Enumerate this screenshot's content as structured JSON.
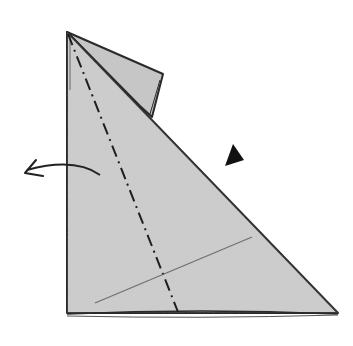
{
  "diagram": {
    "type": "origami-step",
    "paper_color": "#c9c9c9",
    "line_color": "#2a2a2a",
    "background": "#ffffff",
    "elements": [
      {
        "name": "folded-paper-triangle",
        "description": "large right triangle of folded paper"
      },
      {
        "name": "back-flap",
        "description": "flap visible behind the top edge"
      },
      {
        "name": "valley-fold-line",
        "style": "dash-dot",
        "description": "fold line from top vertex down to bottom edge"
      },
      {
        "name": "reference-crease",
        "style": "thin",
        "description": "existing crease across lower section"
      },
      {
        "name": "fold-direction-arrow",
        "direction": "left",
        "description": "curved arrow indicating fold to the left"
      },
      {
        "name": "push-arrow",
        "shape": "filled-triangle",
        "description": "black triangle indicating press/sink"
      }
    ]
  }
}
